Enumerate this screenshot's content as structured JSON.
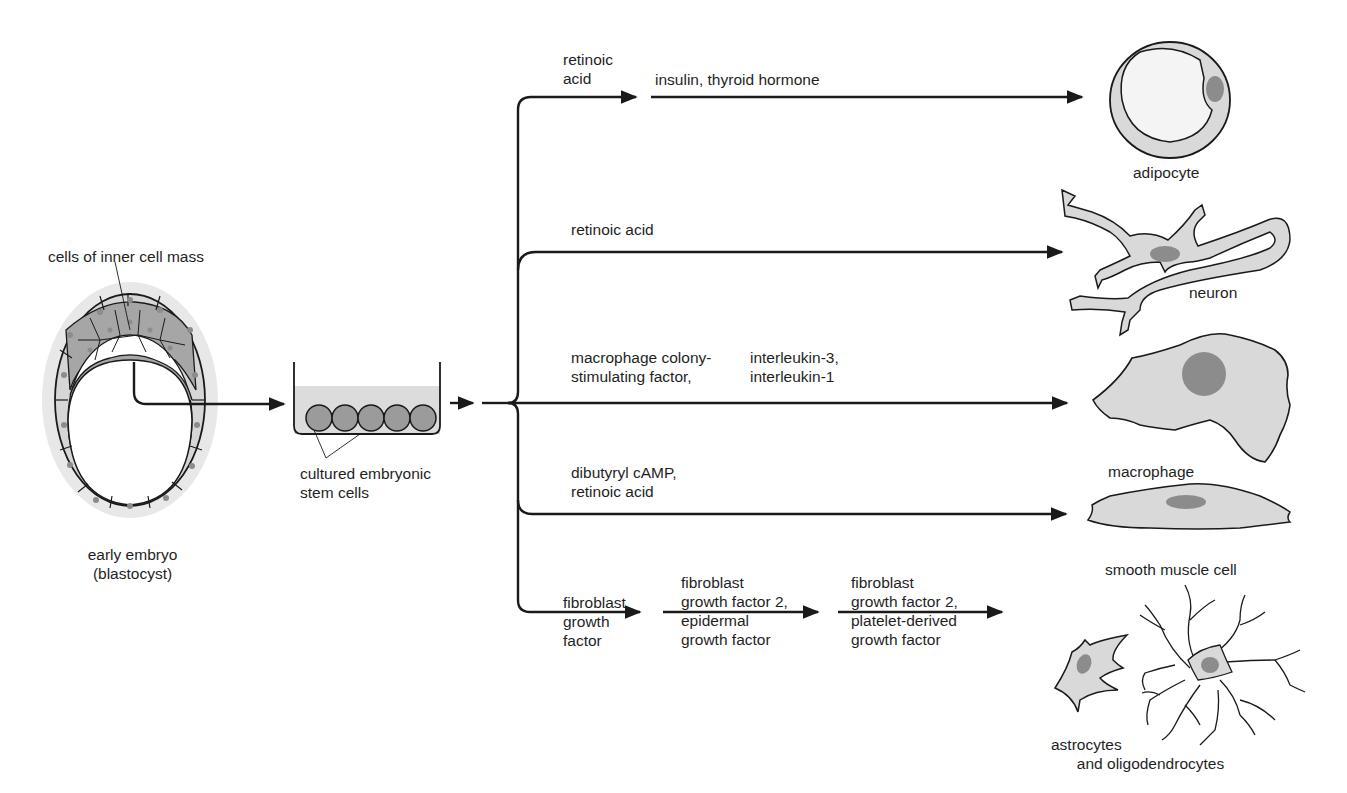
{
  "source": {
    "embryo_label": "early embryo\n(blastocyst)",
    "icm_label": "cells of inner cell mass",
    "culture_label": "cultured embryonic\nstem cells"
  },
  "pathways": [
    {
      "id": "adipocyte",
      "steps": [
        "retinoic\nacid",
        "insulin, thyroid hormone"
      ],
      "cell_label": "adipocyte"
    },
    {
      "id": "neuron",
      "steps": [
        "retinoic acid"
      ],
      "cell_label": "neuron"
    },
    {
      "id": "macrophage",
      "steps": [
        "macrophage colony-\nstimulating factor,",
        "interleukin-3,\ninterleukin-1"
      ],
      "cell_label": "macrophage"
    },
    {
      "id": "smooth-muscle",
      "steps": [
        "dibutyryl cAMP,\nretinoic acid"
      ],
      "cell_label": "smooth muscle cell"
    },
    {
      "id": "glia",
      "steps": [
        "fibroblast\ngrowth\nfactor",
        "fibroblast\ngrowth factor 2,\nepidermal\ngrowth factor",
        "fibroblast\ngrowth factor 2,\nplatelet-derived\ngrowth factor"
      ],
      "cell_label": "astrocytes\n      and oligodendrocytes"
    }
  ],
  "colors": {
    "line": "#1a1a1a",
    "cell_fill": "#d9d9d9",
    "inner_mass_fill": "#a6a6a6",
    "nucleus": "#8c8c8c",
    "medium": "#dcdcdc",
    "halo": "#e8e8e8"
  }
}
